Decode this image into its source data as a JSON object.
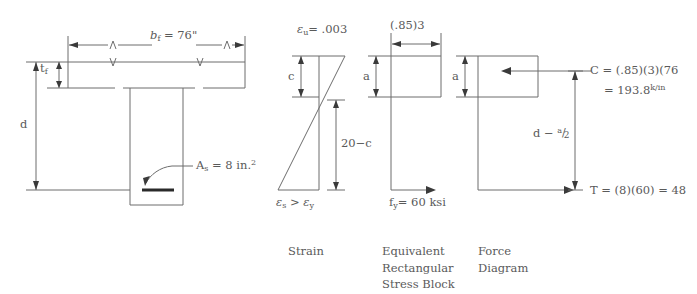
{
  "figure": {
    "type": "engineering-diagram",
    "captions": {
      "strain": "Strain",
      "stress_block_line1": "Equivalent",
      "stress_block_line2": "Rectangular",
      "stress_block_line3": "Stress  Block",
      "force_line1": "Force",
      "force_line2": "Diagram"
    }
  },
  "section": {
    "flange_width_label": "b",
    "flange_width_sub": "f",
    "flange_width_value": "=  76\"",
    "flange_thickness_label": "t",
    "flange_thickness_sub": "f",
    "depth_label": "d",
    "steel_area_label": "A",
    "steel_area_sub": "s",
    "steel_area_value": "=  8  in.",
    "steel_area_exp": "2"
  },
  "strain": {
    "top_strain_symbol": "ε",
    "top_strain_sub": "u",
    "top_strain_value": "=  .003",
    "neutral_axis_label": "c",
    "lower_dim_label": "20−c",
    "steel_strain_symbol": "ε",
    "steel_strain_sub": "s",
    "steel_strain_relation": ">",
    "yield_strain_symbol": "ε",
    "yield_strain_sub": "y"
  },
  "stress_block": {
    "top_label": "(.85)3",
    "depth_label": "a",
    "yield_stress_symbol": "f",
    "yield_stress_sub": "y",
    "yield_stress_value": "=  60  ksi"
  },
  "force": {
    "depth_label": "a",
    "compression_label": "C",
    "compression_eq1": "=   (.85)(3)(76",
    "compression_eq2": "=  193.8",
    "compression_eq2_exp": "k/in",
    "lever_arm_d": "d",
    "lever_arm_minus": "−",
    "lever_arm_num": "a",
    "lever_arm_slash": "/",
    "lever_arm_den": "2",
    "tension_label": "T",
    "tension_eq": "=  (8)(60)  =  48"
  },
  "colors": {
    "line": "#6d6d6d",
    "dark_line": "#2a2a2a",
    "text": "#5a5a5a",
    "background": "#ffffff"
  }
}
